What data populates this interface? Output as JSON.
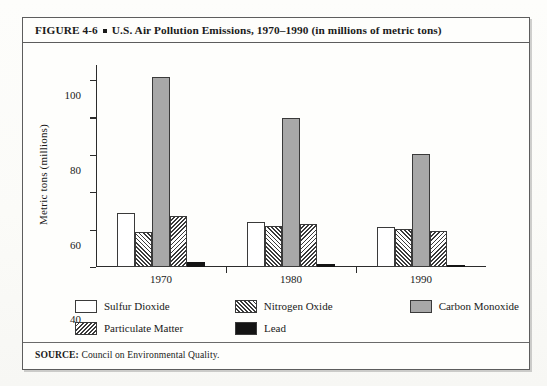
{
  "figure": {
    "label": "FIGURE 4-6",
    "bullet": "square-bullet",
    "title": "U.S. Air Pollution Emissions, 1970–1990 (in millions of metric tons)",
    "source_prefix": "SOURCE:",
    "source_text": " Council on Environmental Quality."
  },
  "chart_data": {
    "type": "bar",
    "title": "U.S. Air Pollution Emissions, 1970–1990 (in millions of metric tons)",
    "xlabel": "",
    "ylabel": "Metric tons (millions)",
    "categories": [
      "1970",
      "1980",
      "1990"
    ],
    "ylim": [
      0,
      108
    ],
    "yticks": [
      0,
      20,
      40,
      60,
      80,
      100
    ],
    "ytick_labels": [
      "0",
      "20",
      "40",
      "60",
      "80",
      "100"
    ],
    "grid": false,
    "legend_position": "below-plot",
    "series": [
      {
        "name": "Sulfur Dioxide",
        "fill": "solid-white",
        "color": "#ffffff",
        "values": [
          29,
          24,
          21.5
        ]
      },
      {
        "name": "Nitrogen Oxide",
        "fill": "hatch-back",
        "color": "#3a3a3a",
        "values": [
          18.5,
          22,
          20.5
        ]
      },
      {
        "name": "Carbon Monoxide",
        "fill": "solid-gray",
        "color": "#a8a8a8",
        "values": [
          101.5,
          79.5,
          60.5
        ]
      },
      {
        "name": "Particulate Matter",
        "fill": "hatch-fwd",
        "color": "#3a3a3a",
        "values": [
          27.5,
          23,
          19
        ]
      },
      {
        "name": "Lead",
        "fill": "solid-black",
        "color": "#141414",
        "values": [
          2.5,
          1.5,
          1.2
        ]
      }
    ]
  }
}
